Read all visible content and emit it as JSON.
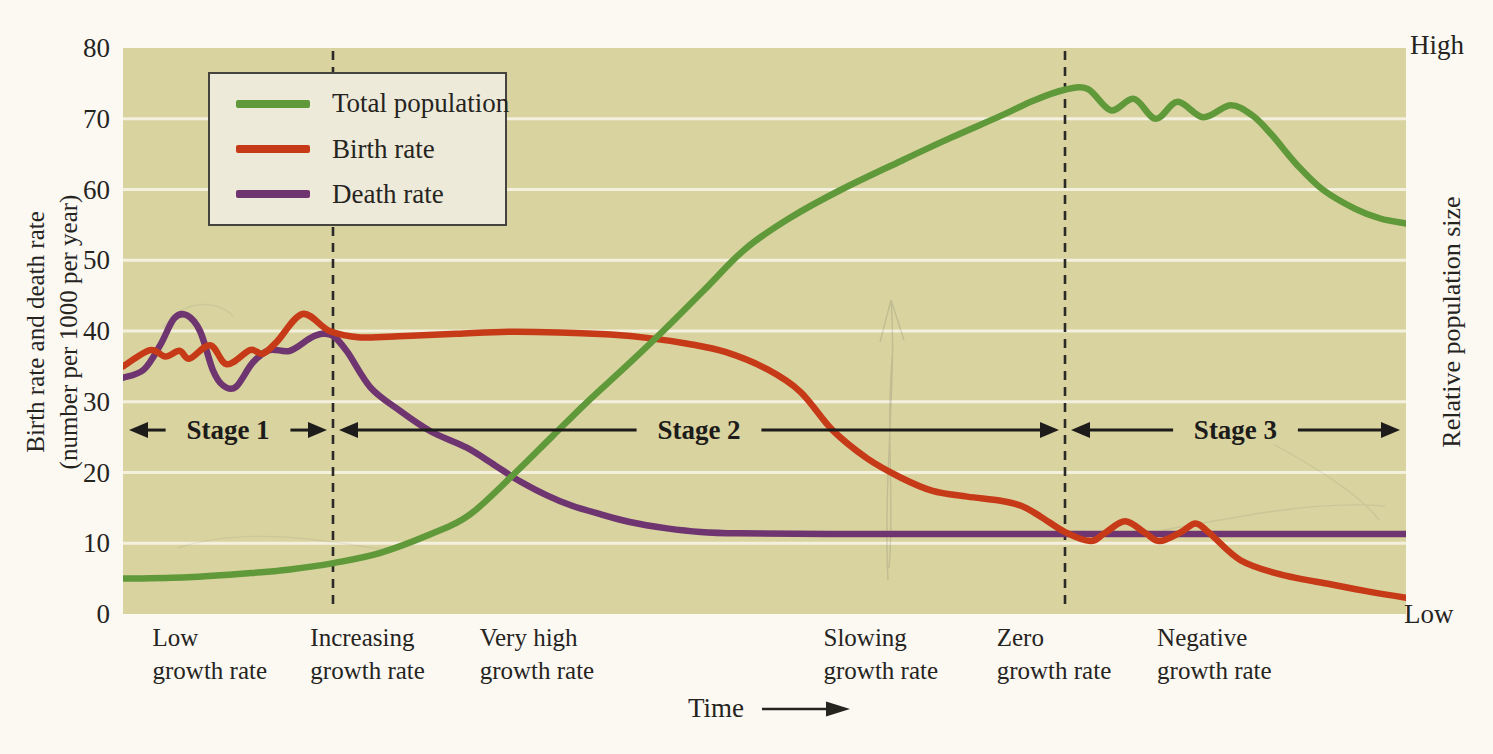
{
  "figure": {
    "left_axis": {
      "title_line1": "Birth rate and death rate",
      "title_line2": "(number per 1000 per year)",
      "ticks": [
        0,
        10,
        20,
        30,
        40,
        50,
        60,
        70,
        80
      ]
    },
    "right_axis": {
      "title": "Relative population size",
      "top_label": "High",
      "bottom_label": "Low"
    },
    "bottom_axis": {
      "title": "Time"
    },
    "legend": {
      "items": [
        {
          "label": "Total population",
          "color": "#60993a"
        },
        {
          "label": "Birth rate",
          "color": "#c63a18"
        },
        {
          "label": "Death rate",
          "color": "#6e3570"
        }
      ]
    },
    "stages": [
      {
        "label": "Stage 1",
        "from_pct": 0,
        "to_pct": 16.37
      },
      {
        "label": "Stage 2",
        "from_pct": 16.37,
        "to_pct": 73.42
      },
      {
        "label": "Stage 3",
        "from_pct": 73.42,
        "to_pct": 100
      }
    ],
    "phases": [
      {
        "line1": "Low",
        "line2": "growth rate",
        "x_pct": 2.3
      },
      {
        "line1": "Increasing",
        "line2": "growth rate",
        "x_pct": 14.6
      },
      {
        "line1": "Very high",
        "line2": "growth rate",
        "x_pct": 27.8
      },
      {
        "line1": "Slowing",
        "line2": "growth rate",
        "x_pct": 54.6
      },
      {
        "line1": "Zero",
        "line2": "growth rate",
        "x_pct": 68.1
      },
      {
        "line1": "Negative",
        "line2": "growth rate",
        "x_pct": 80.6
      }
    ],
    "colors": {
      "page_bg": "#fbf9f1",
      "plot_bg": "#d9d3a0",
      "gridline": "#f4f0de",
      "dash_line": "#2b2a27",
      "text": "#26241f",
      "legend_bg": "#edead9",
      "legend_border": "#45433d"
    }
  },
  "chart_data": {
    "type": "line",
    "title": "",
    "x_axis": {
      "label": "Time",
      "unit": "relative (no numeric scale shown)",
      "range_pct": [
        0,
        100
      ]
    },
    "y_axis_left": {
      "label": "Birth rate and death rate (number per 1000 per year)",
      "range": [
        0,
        80
      ],
      "ticks": [
        0,
        10,
        20,
        30,
        40,
        50,
        60,
        70,
        80
      ],
      "gridline_values": [
        10,
        20,
        30,
        40,
        50,
        60,
        70
      ]
    },
    "y_axis_right": {
      "label": "Relative population size",
      "qualitative_range": [
        "Low",
        "High"
      ]
    },
    "stage_boundaries_pct": [
      16.37,
      73.42
    ],
    "stage_arrow_value": 26,
    "legend_position": "top-left",
    "grid": "horizontal",
    "series": [
      {
        "name": "Death rate",
        "color": "#6e3570",
        "axis": "left",
        "points": [
          [
            0,
            33.4
          ],
          [
            1.6,
            34.5
          ],
          [
            2.9,
            38
          ],
          [
            4,
            41.8
          ],
          [
            5,
            42.2
          ],
          [
            6,
            40
          ],
          [
            7,
            34.5
          ],
          [
            7.8,
            32.3
          ],
          [
            8.8,
            32.1
          ],
          [
            10.1,
            35.5
          ],
          [
            11.4,
            37.3
          ],
          [
            13,
            37.2
          ],
          [
            14.6,
            39
          ],
          [
            15.5,
            39.6
          ],
          [
            16.4,
            39.3
          ],
          [
            17.5,
            37
          ],
          [
            19.3,
            32
          ],
          [
            21.6,
            28.7
          ],
          [
            24,
            25.8
          ],
          [
            26.8,
            23.5
          ],
          [
            29,
            21
          ],
          [
            30.9,
            18.8
          ],
          [
            33,
            16.8
          ],
          [
            35,
            15.3
          ],
          [
            37.2,
            14.1
          ],
          [
            39.5,
            13
          ],
          [
            42.4,
            12.1
          ],
          [
            45,
            11.6
          ],
          [
            48,
            11.4
          ],
          [
            55,
            11.3
          ],
          [
            65,
            11.3
          ],
          [
            75,
            11.3
          ],
          [
            85,
            11.3
          ],
          [
            100,
            11.3
          ]
        ]
      },
      {
        "name": "Birth rate",
        "color": "#c63a18",
        "axis": "left",
        "points": [
          [
            0,
            35
          ],
          [
            2.1,
            37.3
          ],
          [
            3.3,
            36.4
          ],
          [
            4.4,
            37.2
          ],
          [
            5.2,
            36.1
          ],
          [
            6.8,
            38
          ],
          [
            8.1,
            35.3
          ],
          [
            9.9,
            37.3
          ],
          [
            10.9,
            36.8
          ],
          [
            12,
            38.5
          ],
          [
            14,
            42.4
          ],
          [
            16.1,
            40
          ],
          [
            18.5,
            39.1
          ],
          [
            22,
            39.3
          ],
          [
            26,
            39.6
          ],
          [
            30,
            39.9
          ],
          [
            34,
            39.8
          ],
          [
            38,
            39.5
          ],
          [
            41,
            39
          ],
          [
            44,
            38.2
          ],
          [
            47,
            37
          ],
          [
            50.2,
            34.6
          ],
          [
            52.8,
            31.4
          ],
          [
            55.3,
            26
          ],
          [
            58,
            22
          ],
          [
            60.6,
            19.3
          ],
          [
            63.1,
            17.4
          ],
          [
            65.8,
            16.6
          ],
          [
            68.4,
            16
          ],
          [
            70,
            15.3
          ],
          [
            71.5,
            13.8
          ],
          [
            73.4,
            11.6
          ],
          [
            75.4,
            10.3
          ],
          [
            76.5,
            11.4
          ],
          [
            78.1,
            13.1
          ],
          [
            79.7,
            11.4
          ],
          [
            80.8,
            10.3
          ],
          [
            82.4,
            11.5
          ],
          [
            83.6,
            12.8
          ],
          [
            84.7,
            11.4
          ],
          [
            87.1,
            7.6
          ],
          [
            90.2,
            5.6
          ],
          [
            94.1,
            4.2
          ],
          [
            97,
            3.2
          ],
          [
            100,
            2.3
          ]
        ]
      },
      {
        "name": "Total population",
        "color": "#60993a",
        "axis": "right",
        "points": [
          [
            0,
            5
          ],
          [
            5,
            5.2
          ],
          [
            10,
            5.8
          ],
          [
            13,
            6.3
          ],
          [
            16.4,
            7.2
          ],
          [
            20,
            8.6
          ],
          [
            24,
            11.3
          ],
          [
            27,
            14
          ],
          [
            30.6,
            20
          ],
          [
            33.4,
            25
          ],
          [
            36.2,
            30
          ],
          [
            39.2,
            35
          ],
          [
            42.1,
            40
          ],
          [
            45.3,
            45.8
          ],
          [
            48.5,
            51.6
          ],
          [
            52,
            56
          ],
          [
            56,
            60
          ],
          [
            60.6,
            64
          ],
          [
            64.5,
            67.3
          ],
          [
            68.4,
            70.4
          ],
          [
            71,
            72.6
          ],
          [
            73.4,
            74.1
          ],
          [
            75.2,
            74.2
          ],
          [
            77,
            71.2
          ],
          [
            78.8,
            72.8
          ],
          [
            80.5,
            70
          ],
          [
            82.2,
            72.4
          ],
          [
            84.2,
            70.2
          ],
          [
            86.3,
            71.9
          ],
          [
            88,
            70.5
          ],
          [
            89.5,
            67.8
          ],
          [
            91.5,
            63.5
          ],
          [
            93.5,
            60
          ],
          [
            96,
            57.3
          ],
          [
            98,
            55.9
          ],
          [
            100,
            55.2
          ]
        ]
      }
    ]
  }
}
